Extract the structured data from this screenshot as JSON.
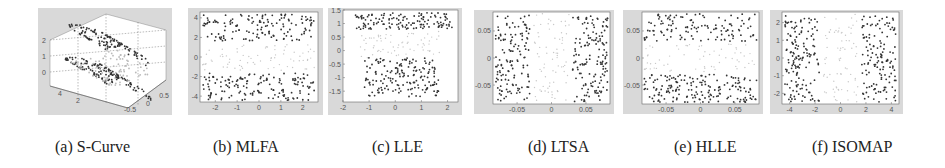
{
  "figure": {
    "panels": [
      {
        "id": "a",
        "caption": "(a) S-Curve",
        "method": "S-Curve"
      },
      {
        "id": "b",
        "caption": "(b) MLFA",
        "method": "MLFA"
      },
      {
        "id": "c",
        "caption": "(c) LLE",
        "method": "LLE"
      },
      {
        "id": "d",
        "caption": "(d) LTSA",
        "method": "LTSA"
      },
      {
        "id": "e",
        "caption": "(e) HLLE",
        "method": "HLLE"
      },
      {
        "id": "f",
        "caption": "(f) ISOMAP",
        "method": "ISOMAP"
      }
    ]
  },
  "chart_data": [
    {
      "type": "scatter",
      "title": "(a) S-Curve",
      "projection": "3d",
      "z_ticks": [
        "0",
        "1",
        "2"
      ],
      "x_ticks": [
        "2",
        "4"
      ],
      "y_ticks": [
        "-0.5",
        "0",
        "0.5"
      ],
      "description": "3D S-shaped manifold of ~400 points; dark points at two ends, light points in the middle",
      "grid": true
    },
    {
      "type": "scatter",
      "title": "(b) MLFA",
      "x_ticks": [
        "-2",
        "-1",
        "0",
        "1",
        "2"
      ],
      "y_ticks": [
        "4",
        "2",
        "0",
        "-2",
        "-4"
      ],
      "xlim": [
        -2.7,
        2.7
      ],
      "ylim": [
        -4.6,
        4.6
      ],
      "description": "Two dark bands at top (y 2..4.5) and bottom (y -2..-4.5), light points in center band"
    },
    {
      "type": "scatter",
      "title": "(c) LLE",
      "x_ticks": [
        "-2",
        "-1",
        "0",
        "1",
        "2"
      ],
      "y_ticks": [
        "1.5",
        "1",
        "0.5",
        "0",
        "-0.5",
        "-1",
        "-1.5"
      ],
      "xlim": [
        -2,
        2.4
      ],
      "ylim": [
        -1.9,
        1.5
      ],
      "description": "Dark cluster top (y 0.8..1.5), dark cluster bottom (y -0.5..-1.8, x -1.2..1.4), light diagonal band in middle"
    },
    {
      "type": "scatter",
      "title": "(d) LTSA",
      "x_ticks": [
        "-0.05",
        "0",
        "0.05"
      ],
      "y_ticks": [
        "0.05",
        "0",
        "-0.05"
      ],
      "xlim": [
        -0.085,
        0.085
      ],
      "ylim": [
        -0.085,
        0.085
      ],
      "description": "Dark vertical bands on left (x -0.085..-0.035) and right (x 0.035..0.085), light points in center"
    },
    {
      "type": "scatter",
      "title": "(e) HLLE",
      "x_ticks": [
        "-0.05",
        "0",
        "0.05"
      ],
      "y_ticks": [
        "0.05",
        "0",
        "-0.05"
      ],
      "xlim": [
        -0.085,
        0.085
      ],
      "ylim": [
        -0.085,
        0.085
      ],
      "description": "Dark horizontal bands top (y 0.03..0.085) and bottom (y -0.03..-0.085), light points in center"
    },
    {
      "type": "scatter",
      "title": "(f) ISOMAP",
      "x_ticks": [
        "-4",
        "-2",
        "0",
        "2",
        "4"
      ],
      "y_ticks": [
        "2",
        "1",
        "0",
        "-1",
        "-2"
      ],
      "xlim": [
        -4.6,
        4.6
      ],
      "ylim": [
        -2.6,
        2.6
      ],
      "description": "Dark vertical bands left (x -4.6..-2) and right (x 2..4.6), light points in center"
    }
  ]
}
